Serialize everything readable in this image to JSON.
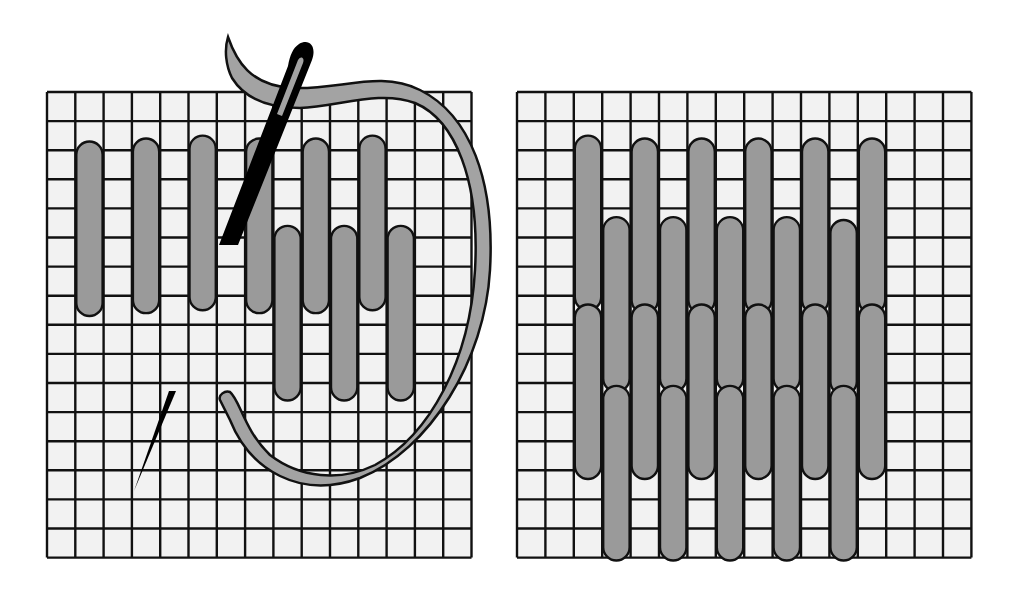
{
  "figure": {
    "title": "",
    "colors": {
      "background": "#ffffff",
      "canvas": "#f2f2f2",
      "grid_line": "#111111",
      "stitch_fill": "#9a9a9a",
      "stitch_outline": "#111111",
      "needle": "#000000",
      "thread": "#a3a3a3"
    }
  },
  "panels": [
    {
      "name": "left-panel-stitching-in-progress",
      "grid": {
        "x": 47,
        "y": 92,
        "cols": 15,
        "rows": 16,
        "cell_w": 28.3,
        "cell_h": 29.1
      },
      "stitches": [
        {
          "col": 1,
          "top": 1.7,
          "bottom": 7.7
        },
        {
          "col": 3,
          "top": 1.6,
          "bottom": 7.6
        },
        {
          "col": 5,
          "top": 1.5,
          "bottom": 7.5
        },
        {
          "col": 7,
          "top": 1.6,
          "bottom": 7.6
        },
        {
          "col": 9,
          "top": 1.6,
          "bottom": 7.6
        },
        {
          "col": 11,
          "top": 1.5,
          "bottom": 7.5
        },
        {
          "col": 8,
          "top": 4.6,
          "bottom": 10.6
        },
        {
          "col": 10,
          "top": 4.6,
          "bottom": 10.6
        },
        {
          "col": 12,
          "top": 4.6,
          "bottom": 10.6
        }
      ],
      "needle_annotation": "needle threaded with yarn entering canvas",
      "needle_tip_annotation": "needle point emerging below"
    },
    {
      "name": "right-panel-finished-pattern",
      "grid": {
        "x": 517,
        "y": 92,
        "cols": 16,
        "rows": 16,
        "cell_w": 28.4,
        "cell_h": 29.1
      },
      "stitches": [
        {
          "col": 2,
          "top": 1.5,
          "bottom": 7.5
        },
        {
          "col": 4,
          "top": 1.6,
          "bottom": 7.6
        },
        {
          "col": 6,
          "top": 1.6,
          "bottom": 7.6
        },
        {
          "col": 8,
          "top": 1.6,
          "bottom": 7.6
        },
        {
          "col": 10,
          "top": 1.6,
          "bottom": 7.6
        },
        {
          "col": 12,
          "top": 1.6,
          "bottom": 7.6
        },
        {
          "col": 3,
          "top": 4.3,
          "bottom": 10.3
        },
        {
          "col": 5,
          "top": 4.3,
          "bottom": 10.3
        },
        {
          "col": 7,
          "top": 4.3,
          "bottom": 10.3
        },
        {
          "col": 9,
          "top": 4.3,
          "bottom": 10.3
        },
        {
          "col": 11,
          "top": 4.4,
          "bottom": 10.4
        },
        {
          "col": 2,
          "top": 7.3,
          "bottom": 13.3
        },
        {
          "col": 4,
          "top": 7.3,
          "bottom": 13.3
        },
        {
          "col": 6,
          "top": 7.3,
          "bottom": 13.3
        },
        {
          "col": 8,
          "top": 7.3,
          "bottom": 13.3
        },
        {
          "col": 10,
          "top": 7.3,
          "bottom": 13.3
        },
        {
          "col": 12,
          "top": 7.3,
          "bottom": 13.3
        },
        {
          "col": 3,
          "top": 10.1,
          "bottom": 16.1
        },
        {
          "col": 5,
          "top": 10.1,
          "bottom": 16.1
        },
        {
          "col": 7,
          "top": 10.1,
          "bottom": 16.1
        },
        {
          "col": 9,
          "top": 10.1,
          "bottom": 16.1
        },
        {
          "col": 11,
          "top": 10.1,
          "bottom": 16.1
        }
      ]
    }
  ]
}
